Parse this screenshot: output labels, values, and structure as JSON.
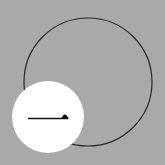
{
  "scene": {
    "background_color": "#a9a9a9",
    "outline_circle": {
      "cx": 88,
      "cy": 82,
      "r": 64,
      "stroke": "#2a2a2a",
      "stroke_width": 1.2
    },
    "badge_circle": {
      "cx": 48,
      "cy": 117,
      "r": 36,
      "fill": "#ffffff"
    },
    "icon": {
      "name": "half-arrow-right-icon",
      "color": "#111111"
    }
  }
}
